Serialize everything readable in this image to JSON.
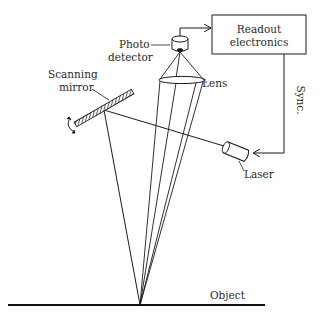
{
  "diagram": {
    "type": "optical-scanning-system",
    "labels": {
      "photo_detector_line1": "Photo",
      "photo_detector_line2": "detector",
      "readout_line1": "Readout",
      "readout_line2": "electronics",
      "lens": "Lens",
      "scanning_mirror_line1": "Scanning",
      "scanning_mirror_line2": "mirror",
      "sync": "Sync.",
      "laser": "Laser",
      "object": "Object"
    },
    "components": [
      {
        "id": "readout-electronics",
        "label": "Readout electronics",
        "shape": "rectangle"
      },
      {
        "id": "photo-detector",
        "label": "Photo detector",
        "shape": "cylinder"
      },
      {
        "id": "lens",
        "label": "Lens",
        "shape": "ellipse"
      },
      {
        "id": "scanning-mirror",
        "label": "Scanning mirror",
        "shape": "hatched-bar"
      },
      {
        "id": "laser",
        "label": "Laser",
        "shape": "cylinder"
      },
      {
        "id": "object",
        "label": "Object",
        "shape": "line"
      }
    ],
    "connections": [
      {
        "from": "photo-detector",
        "to": "readout-electronics",
        "arrow": true
      },
      {
        "from": "readout-electronics",
        "to": "laser",
        "label": "Sync.",
        "arrow": true
      },
      {
        "from": "laser",
        "to": "scanning-mirror",
        "type": "beam"
      },
      {
        "from": "scanning-mirror",
        "to": "object",
        "type": "beam"
      },
      {
        "from": "object",
        "to": "lens",
        "type": "reflected-rays"
      },
      {
        "from": "lens",
        "to": "photo-detector",
        "type": "focused-rays"
      }
    ],
    "colors": {
      "stroke": "#1a1a1a",
      "background": "#ffffff"
    }
  }
}
